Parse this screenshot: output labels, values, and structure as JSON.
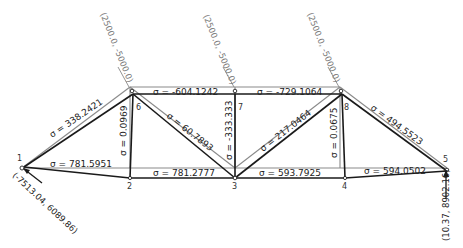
{
  "diagram": {
    "type": "truss-stress-analysis",
    "nodes": [
      {
        "id": "1",
        "label": "1"
      },
      {
        "id": "2",
        "label": "2"
      },
      {
        "id": "3",
        "label": "3"
      },
      {
        "id": "4",
        "label": "4"
      },
      {
        "id": "5",
        "label": "5"
      },
      {
        "id": "6",
        "label": "6"
      },
      {
        "id": "7",
        "label": "7"
      },
      {
        "id": "8",
        "label": "8"
      }
    ],
    "members": [
      {
        "from": "1",
        "to": "6",
        "stress": "σ = 338.2421"
      },
      {
        "from": "1",
        "to": "2",
        "stress": "σ = 781.5951"
      },
      {
        "from": "2",
        "to": "6",
        "stress": "σ = 0.0969"
      },
      {
        "from": "6",
        "to": "7",
        "stress": "σ = -604.1242"
      },
      {
        "from": "6",
        "to": "3",
        "stress": "σ = 60.7893"
      },
      {
        "from": "2",
        "to": "3",
        "stress": "σ = 781.2777"
      },
      {
        "from": "7",
        "to": "3",
        "stress": "σ = -333.333"
      },
      {
        "from": "7",
        "to": "8",
        "stress": "σ = -729.1064"
      },
      {
        "from": "3",
        "to": "8",
        "stress": "σ = 217.0464"
      },
      {
        "from": "3",
        "to": "4",
        "stress": "σ = 593.7925"
      },
      {
        "from": "4",
        "to": "8",
        "stress": "σ = 0.0675"
      },
      {
        "from": "8",
        "to": "5",
        "stress": "σ = 494.5523"
      },
      {
        "from": "4",
        "to": "5",
        "stress": "σ = 594.0502"
      }
    ],
    "loads": [
      {
        "node": "6",
        "label": "(2500.0, -5000.0)"
      },
      {
        "node": "7",
        "label": "(2500.0, -5000.0)"
      },
      {
        "node": "8",
        "label": "(2500.0, -5000.0)"
      }
    ],
    "reactions": [
      {
        "node": "1",
        "label": "(-7513.04, 6089.86)"
      },
      {
        "node": "5",
        "label": "(10.37, 8902.16)"
      }
    ]
  }
}
